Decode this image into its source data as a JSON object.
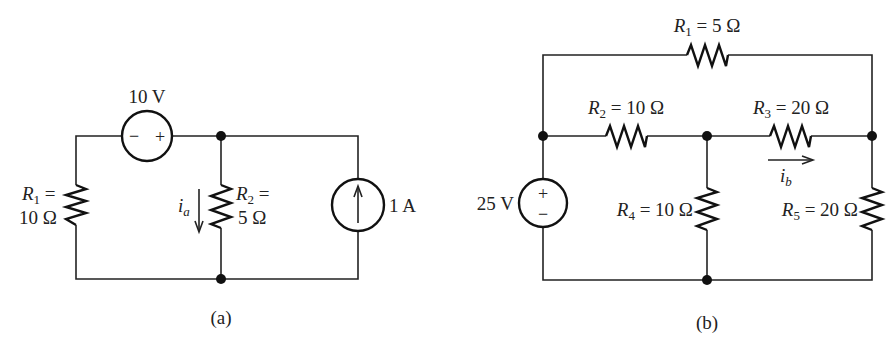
{
  "figure": {
    "panels": [
      {
        "id": "a",
        "caption": "(a)",
        "voltage_source": {
          "value": "10 V",
          "polarity_left": "−",
          "polarity_right": "+"
        },
        "current_source": {
          "value": "1 A",
          "direction": "up"
        },
        "resistors": [
          {
            "name": "R",
            "sub": "1",
            "eq": " =",
            "value": "10 Ω"
          },
          {
            "name": "R",
            "sub": "2",
            "eq": " =",
            "value": "5 Ω"
          }
        ],
        "current_label": {
          "name": "i",
          "sub": "a",
          "direction": "down"
        }
      },
      {
        "id": "b",
        "caption": "(b)",
        "voltage_source": {
          "value": "25 V",
          "polarity_top": "+",
          "polarity_bottom": "−"
        },
        "resistors": [
          {
            "name": "R",
            "sub": "1",
            "value": " = 5 Ω"
          },
          {
            "name": "R",
            "sub": "2",
            "value": " = 10 Ω"
          },
          {
            "name": "R",
            "sub": "3",
            "value": " = 20 Ω"
          },
          {
            "name": "R",
            "sub": "4",
            "value": " = 10 Ω"
          },
          {
            "name": "R",
            "sub": "5",
            "value": " = 20 Ω"
          }
        ],
        "current_label": {
          "name": "i",
          "sub": "b",
          "direction": "right"
        }
      }
    ]
  }
}
